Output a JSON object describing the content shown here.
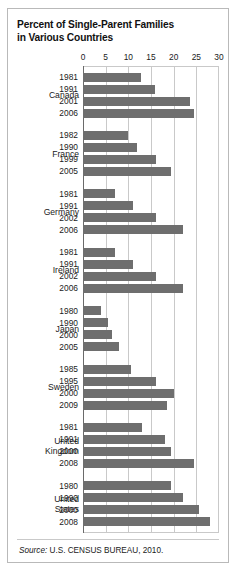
{
  "title": {
    "line1": "Percent of Single-Parent Families",
    "line2": "in Various Countries"
  },
  "source": {
    "label": "Source:",
    "text": " U.S. CENSUS BUREAU, 2010."
  },
  "colors": {
    "bar": "#6e6e6e",
    "grid": "#c9c9c9",
    "axis": "#6a6a6a",
    "frame": "#b9b9b9",
    "background": "#ffffff",
    "text": "#1a1a1a"
  },
  "chart_data": {
    "type": "bar",
    "orientation": "horizontal",
    "title": "Percent of Single-Parent Families in Various Countries",
    "subtitle": "",
    "xlabel": "",
    "ylabel": "",
    "xlim": [
      0,
      30
    ],
    "xticks": [
      0,
      5,
      10,
      15,
      20,
      25,
      30
    ],
    "xtick_labels": [
      "0",
      "5",
      "10",
      "15",
      "20",
      "25",
      "30"
    ],
    "grid": true,
    "legend": "none",
    "value_unit": "percent",
    "groups": [
      {
        "name": "Canada",
        "name_lines": [
          "Canada"
        ],
        "categories": [
          "1981",
          "1991",
          "2001",
          "2006"
        ],
        "values": [
          12.8,
          15.8,
          23.5,
          24.5
        ]
      },
      {
        "name": "France",
        "name_lines": [
          "France"
        ],
        "categories": [
          "1982",
          "1990",
          "1999",
          "2005"
        ],
        "values": [
          10.0,
          12.0,
          16.0,
          19.5
        ]
      },
      {
        "name": "Germany",
        "name_lines": [
          "Germany"
        ],
        "categories": [
          "1981",
          "1991",
          "2002",
          "2006"
        ],
        "values": [
          7.0,
          11.0,
          16.0,
          22.0
        ]
      },
      {
        "name": "Ireland",
        "name_lines": [
          "Ireland"
        ],
        "categories": [
          "1981",
          "1991",
          "2002",
          "2006"
        ],
        "values": [
          7.0,
          11.0,
          16.0,
          22.0
        ]
      },
      {
        "name": "Japan",
        "name_lines": [
          "Japan"
        ],
        "categories": [
          "1980",
          "1990",
          "2000",
          "2005"
        ],
        "values": [
          4.0,
          5.5,
          6.5,
          8.0
        ]
      },
      {
        "name": "Sweden",
        "name_lines": [
          "Sweden"
        ],
        "categories": [
          "1985",
          "1995",
          "2000",
          "2009"
        ],
        "values": [
          10.5,
          16.0,
          20.0,
          18.5
        ]
      },
      {
        "name": "United Kingdom",
        "name_lines": [
          "United",
          "Kingdom"
        ],
        "categories": [
          "1981",
          "1991",
          "2000",
          "2008"
        ],
        "values": [
          13.0,
          18.0,
          19.5,
          24.5
        ]
      },
      {
        "name": "United States",
        "name_lines": [
          "United",
          "States"
        ],
        "categories": [
          "1980",
          "1990",
          "2000",
          "2008"
        ],
        "values": [
          19.5,
          22.0,
          25.5,
          28.0
        ]
      }
    ]
  }
}
